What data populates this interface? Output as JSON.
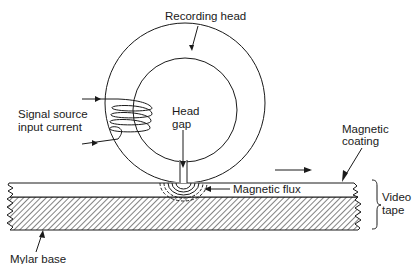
{
  "diagram": {
    "labels": {
      "recording_head": "Recording head",
      "signal_source_line1": "Signal source",
      "signal_source_line2": "input current",
      "head_gap_line1": "Head",
      "head_gap_line2": "gap",
      "magnetic_coating_line1": "Magnetic",
      "magnetic_coating_line2": "coating",
      "magnetic_flux": "Magnetic flux",
      "video_tape_line1": "Video",
      "video_tape_line2": "tape",
      "mylar_base": "Mylar base"
    },
    "components": [
      "recording-head",
      "coil",
      "head-gap",
      "magnetic-coating",
      "mylar-base",
      "magnetic-flux"
    ],
    "tape_motion": "left-to-right"
  },
  "colors": {
    "ink": "#1a1a1a",
    "background": "#ffffff"
  }
}
